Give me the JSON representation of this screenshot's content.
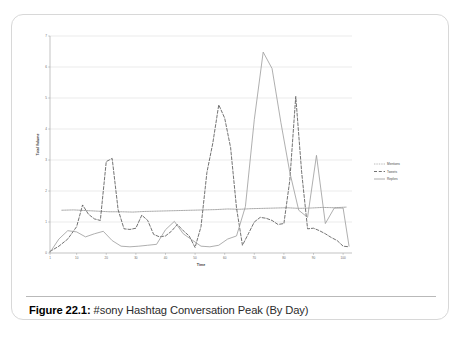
{
  "caption": {
    "figure_label": "Figure 22.1:",
    "text": " #sony Hashtag Conversation Peak (By Day)"
  },
  "chart_data": {
    "type": "line",
    "title": "",
    "xlabel": "Time",
    "ylabel": "Total Volume",
    "xlim": [
      1,
      103
    ],
    "ylim": [
      0,
      7
    ],
    "grid": true,
    "legend_position": "right",
    "xticks": [
      1,
      10,
      20,
      30,
      40,
      50,
      60,
      70,
      80,
      90,
      100
    ],
    "xtick_labels": [
      "1",
      "10",
      "20",
      "30",
      "40",
      "50",
      "60",
      "70",
      "80",
      "90",
      "100"
    ],
    "yticks": [
      0,
      1,
      2,
      3,
      4,
      5,
      6,
      7
    ],
    "ytick_labels": [
      "0",
      "1",
      "2",
      "3",
      "4",
      "5",
      "6",
      "7"
    ],
    "series": [
      {
        "name": "Mentions",
        "style": "dotted",
        "color": "#8d8d8d",
        "x": [
          5,
          9,
          13,
          17,
          21,
          25,
          29,
          33,
          37,
          41,
          45,
          49,
          53,
          57,
          61,
          65,
          69,
          73,
          77,
          81,
          85,
          89,
          93,
          97,
          101
        ],
        "values": [
          1.38,
          1.39,
          1.37,
          1.35,
          1.33,
          1.33,
          1.32,
          1.34,
          1.35,
          1.36,
          1.37,
          1.38,
          1.39,
          1.4,
          1.42,
          1.41,
          1.43,
          1.44,
          1.45,
          1.46,
          1.44,
          1.45,
          1.47,
          1.46,
          1.48
        ]
      },
      {
        "name": "Tweets",
        "style": "dashed",
        "color": "#4f4f4f",
        "x": [
          1,
          4,
          7,
          10,
          12,
          14,
          16,
          18,
          20,
          22,
          24,
          26,
          28,
          30,
          32,
          34,
          36,
          38,
          40,
          42,
          44,
          46,
          48,
          50,
          52,
          54,
          56,
          58,
          60,
          62,
          64,
          66,
          68,
          70,
          72,
          74,
          76,
          78,
          80,
          82,
          84,
          86,
          88,
          90,
          92,
          94,
          96,
          98,
          100,
          102
        ],
        "values": [
          0.05,
          0.22,
          0.45,
          0.85,
          1.55,
          1.25,
          1.1,
          1.05,
          2.95,
          3.05,
          1.4,
          0.78,
          0.76,
          0.8,
          1.22,
          1.05,
          0.6,
          0.52,
          0.55,
          0.7,
          0.92,
          0.72,
          0.55,
          0.18,
          0.85,
          2.6,
          3.55,
          4.78,
          4.35,
          3.4,
          1.45,
          0.25,
          0.62,
          1.0,
          1.15,
          1.12,
          1.05,
          0.92,
          0.95,
          2.35,
          5.05,
          2.6,
          0.78,
          0.8,
          0.72,
          0.62,
          0.5,
          0.4,
          0.22,
          0.2
        ]
      },
      {
        "name": "Replies",
        "style": "solid",
        "color": "#9b9b9b",
        "x": [
          1,
          4,
          7,
          10,
          13,
          16,
          19,
          22,
          25,
          28,
          31,
          34,
          37,
          40,
          43,
          46,
          49,
          52,
          55,
          58,
          61,
          64,
          67,
          70,
          73,
          76,
          79,
          82,
          85,
          88,
          91,
          94,
          97,
          100,
          102
        ],
        "values": [
          0.02,
          0.45,
          0.72,
          0.68,
          0.52,
          0.62,
          0.7,
          0.4,
          0.22,
          0.2,
          0.22,
          0.25,
          0.28,
          0.75,
          1.02,
          0.62,
          0.42,
          0.22,
          0.2,
          0.25,
          0.45,
          0.55,
          1.5,
          4.3,
          6.48,
          5.95,
          4.2,
          2.6,
          1.38,
          1.15,
          3.15,
          0.95,
          1.45,
          1.45,
          0.22
        ]
      }
    ]
  }
}
